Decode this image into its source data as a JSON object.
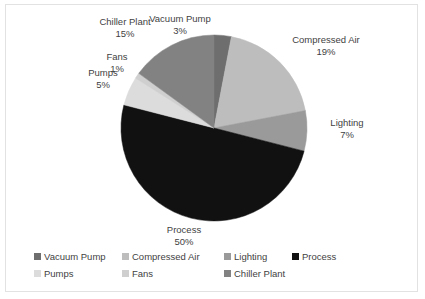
{
  "chart_data": {
    "type": "pie",
    "title": "",
    "subtitle": "",
    "xlabel": "",
    "ylabel": "",
    "grid": false,
    "legend_position": "bottom",
    "start_angle_deg": 0,
    "direction": "clockwise",
    "categories": [
      "Vacuum Pump",
      "Compressed Air",
      "Lighting",
      "Process",
      "Pumps",
      "Fans",
      "Chiller Plant"
    ],
    "values": [
      3,
      19,
      7,
      50,
      5,
      1,
      15
    ],
    "units": "%",
    "colors": [
      "#6e6e6e",
      "#bdbdbd",
      "#9a9a9a",
      "#111111",
      "#dcdcdc",
      "#cfcfcf",
      "#828282"
    ],
    "slices": [
      {
        "label": "Vacuum Pump",
        "value": 3,
        "value_text": "3%",
        "color": "#6e6e6e"
      },
      {
        "label": "Compressed Air",
        "value": 19,
        "value_text": "19%",
        "color": "#bdbdbd"
      },
      {
        "label": "Lighting",
        "value": 7,
        "value_text": "7%",
        "color": "#9a9a9a"
      },
      {
        "label": "Process",
        "value": 50,
        "value_text": "50%",
        "color": "#111111"
      },
      {
        "label": "Pumps",
        "value": 5,
        "value_text": "5%",
        "color": "#dcdcdc"
      },
      {
        "label": "Fans",
        "value": 1,
        "value_text": "1%",
        "color": "#cfcfcf"
      },
      {
        "label": "Chiller Plant",
        "value": 15,
        "value_text": "15%",
        "color": "#828282"
      }
    ]
  },
  "labels": {
    "vacuum_pump": {
      "name": "Vacuum Pump",
      "value": "3%"
    },
    "compressed_air": {
      "name": "Compressed Air",
      "value": "19%"
    },
    "lighting": {
      "name": "Lighting",
      "value": "7%"
    },
    "process": {
      "name": "Process",
      "value": "50%"
    },
    "pumps": {
      "name": "Pumps",
      "value": "5%"
    },
    "fans": {
      "name": "Fans",
      "value": "1%"
    },
    "chiller_plant": {
      "name": "Chiller Plant",
      "value": "15%"
    }
  },
  "legend": {
    "rows": [
      [
        {
          "label": "Vacuum Pump",
          "color": "#6e6e6e"
        },
        {
          "label": "Compressed Air",
          "color": "#bdbdbd"
        },
        {
          "label": "Lighting",
          "color": "#9a9a9a"
        },
        {
          "label": "Process",
          "color": "#111111"
        }
      ],
      [
        {
          "label": "Pumps",
          "color": "#dcdcdc"
        },
        {
          "label": "Fans",
          "color": "#cfcfcf"
        },
        {
          "label": "Chiller Plant",
          "color": "#828282"
        }
      ]
    ]
  },
  "frame": {
    "border_color": "#e2e2e2",
    "background": "#ffffff"
  }
}
